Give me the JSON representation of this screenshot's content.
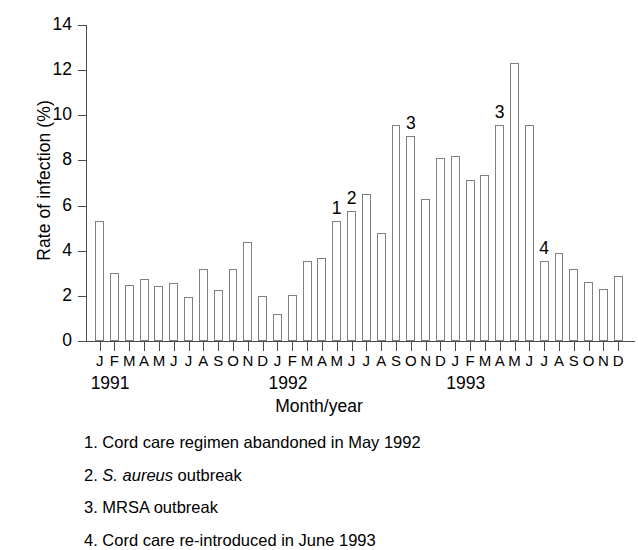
{
  "chart_data": {
    "type": "bar",
    "title": "",
    "xlabel": "Month/year",
    "ylabel": "Rate of infection (%)",
    "ylim": [
      0,
      14
    ],
    "yticks": [
      0,
      2,
      4,
      6,
      8,
      10,
      12,
      14
    ],
    "ytick_labels": [
      "0",
      "2",
      "4",
      "6",
      "8",
      "10",
      "12",
      "14"
    ],
    "grid": false,
    "legend": "none",
    "bar_style": "open white bars with thin gray outline",
    "categories": [
      "J",
      "F",
      "M",
      "A",
      "M",
      "J",
      "J",
      "A",
      "S",
      "O",
      "N",
      "D",
      "J",
      "F",
      "M",
      "A",
      "M",
      "J",
      "J",
      "A",
      "S",
      "O",
      "N",
      "D",
      "J",
      "F",
      "M",
      "A",
      "M",
      "J",
      "J",
      "A",
      "S",
      "O",
      "N",
      "D"
    ],
    "x": [
      "Jan 1991",
      "Feb 1991",
      "Mar 1991",
      "Apr 1991",
      "May 1991",
      "Jun 1991",
      "Jul 1991",
      "Aug 1991",
      "Sep 1991",
      "Oct 1991",
      "Nov 1991",
      "Dec 1991",
      "Jan 1992",
      "Feb 1992",
      "Mar 1992",
      "Apr 1992",
      "May 1992",
      "Jun 1992",
      "Jul 1992",
      "Aug 1992",
      "Sep 1992",
      "Oct 1992",
      "Nov 1992",
      "Dec 1992",
      "Jan 1993",
      "Feb 1993",
      "Mar 1993",
      "Apr 1993",
      "May 1993",
      "Jun 1993",
      "Jul 1993",
      "Aug 1993",
      "Sep 1993",
      "Oct 1993",
      "Nov 1993",
      "Dec 1993"
    ],
    "values": [
      5.3,
      3.0,
      2.5,
      2.75,
      2.45,
      2.55,
      1.95,
      3.2,
      2.25,
      3.2,
      4.4,
      2.0,
      1.2,
      2.05,
      3.55,
      3.7,
      5.3,
      5.75,
      6.5,
      4.8,
      9.55,
      9.1,
      6.3,
      8.1,
      8.2,
      7.15,
      7.35,
      9.55,
      12.3,
      9.55,
      3.55,
      3.9,
      3.2,
      2.6,
      2.3,
      2.9
    ],
    "callouts": [
      {
        "label": "1",
        "category_index": 16,
        "value": 5.3
      },
      {
        "label": "2",
        "category_index": 17,
        "value": 5.75
      },
      {
        "label": "3",
        "category_index": 21,
        "value": 9.1
      },
      {
        "label": "3",
        "category_index": 27,
        "value": 9.55
      },
      {
        "label": "4",
        "category_index": 30,
        "value": 3.55
      }
    ],
    "year_groups": [
      {
        "label": "1991",
        "start_index": 0,
        "end_index": 11
      },
      {
        "label": "1992",
        "start_index": 12,
        "end_index": 23
      },
      {
        "label": "1993",
        "start_index": 24,
        "end_index": 35
      }
    ]
  },
  "footnotes": [
    {
      "number": "1.",
      "text_before": " Cord care regimen abandoned in May 1992",
      "italic": "",
      "text_after": ""
    },
    {
      "number": "2.",
      "text_before": " ",
      "italic": "S. aureus",
      "text_after": " outbreak"
    },
    {
      "number": "3.",
      "text_before": " MRSA outbreak",
      "italic": "",
      "text_after": ""
    },
    {
      "number": "4.",
      "text_before": " Cord care re-introduced in June 1993",
      "italic": "",
      "text_after": ""
    }
  ],
  "colors": {
    "bar_fill": "#ffffff",
    "bar_stroke": "#808080",
    "axis": "#4a4a4a",
    "text": "#000000",
    "background": "#ffffff"
  }
}
